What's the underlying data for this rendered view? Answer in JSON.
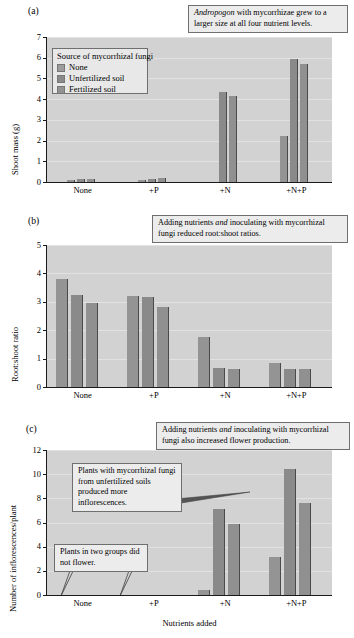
{
  "figure": {
    "xlabel": "Nutrients added",
    "categories": [
      "None",
      "+P",
      "+N",
      "+N+P"
    ],
    "series_names": [
      "None",
      "Unfertilized soil",
      "Fertilized soil"
    ],
    "legend_title": "Source of mycorrhizal fungi",
    "colors": {
      "plot_background": "#d2d2d2",
      "bar_none": "#949494",
      "bar_unfertilized": "#8a8a8a",
      "bar_fertilized": "#909090",
      "callout_background": "#ececec",
      "callout_border": "#6f6f6f",
      "gridline": "#e2e2e2",
      "axis": "#1a1a1a"
    }
  },
  "panels": {
    "a": {
      "label": "(a)",
      "callout": "Andropogon with mycorrhizae grew to a larger size at all four nutrient levels.",
      "callout_italic_word": "Andropogon"
    },
    "b": {
      "label": "(b)",
      "callout": "Adding nutrients and inoculating with mycorrhizal fungi reduced root:shoot ratios.",
      "callout_italic_word": "and"
    },
    "c": {
      "label": "(c)",
      "callout_main": "Adding nutrients and inoculating with mycorrhizal fungi also increased flower production.",
      "callout_main_italic_word": "and",
      "callout_mid": "Plants with mycorrhizal fungi from unfertilized soils produced more inflorescences.",
      "callout_low": "Plants in two groups did not flower."
    }
  },
  "chart_data": [
    {
      "type": "bar",
      "panel": "a",
      "title": "",
      "xlabel": "",
      "ylabel": "Shoot mass (g)",
      "categories": [
        "None",
        "+P",
        "+N",
        "+N+P"
      ],
      "series": [
        {
          "name": "None",
          "values": [
            0.12,
            0.1,
            0.0,
            0.0
          ]
        },
        {
          "name": "Unfertilized soil",
          "values": [
            0.15,
            0.13,
            4.33,
            5.95
          ]
        },
        {
          "name": "Fertilized soil",
          "values": [
            0.15,
            0.2,
            4.15,
            5.7
          ]
        }
      ],
      "special_bars": {
        "note": "+N and +N+P 'None' series bars are absent; +N+P shows a 2.2 bar between groups"
      },
      "extra_bars": [
        {
          "category": "+N+P",
          "series": "None",
          "value": 2.2
        }
      ],
      "ylim": [
        0,
        7
      ],
      "yticks": [
        0,
        1,
        2,
        3,
        4,
        5,
        6,
        7
      ],
      "grid": true,
      "legend_position": "upper-left"
    },
    {
      "type": "bar",
      "panel": "b",
      "title": "",
      "xlabel": "",
      "ylabel": "Root:shoot ratio",
      "categories": [
        "None",
        "+P",
        "+N",
        "+N+P"
      ],
      "series": [
        {
          "name": "None",
          "values": [
            3.82,
            3.22,
            1.77,
            0.85
          ]
        },
        {
          "name": "Unfertilized soil",
          "values": [
            3.23,
            3.18,
            0.67,
            0.63
          ]
        },
        {
          "name": "Fertilized soil",
          "values": [
            2.95,
            2.82,
            0.65,
            0.64
          ]
        }
      ],
      "ylim": [
        0,
        5
      ],
      "yticks": [
        0,
        1,
        2,
        3,
        4,
        5
      ],
      "grid": true,
      "legend_position": "none"
    },
    {
      "type": "bar",
      "panel": "c",
      "title": "",
      "xlabel": "Nutrients added",
      "ylabel": "Number of inflorescences/plant",
      "categories": [
        "None",
        "+P",
        "+N",
        "+N+P"
      ],
      "series": [
        {
          "name": "None",
          "values": [
            0.0,
            0.0,
            0.45,
            3.15
          ]
        },
        {
          "name": "Unfertilized soil",
          "values": [
            0.0,
            0.0,
            7.15,
            10.4
          ]
        },
        {
          "name": "Fertilized soil",
          "values": [
            0.0,
            0.0,
            5.85,
            7.6
          ]
        }
      ],
      "ylim": [
        0,
        12
      ],
      "yticks": [
        0,
        2,
        4,
        6,
        8,
        10,
        12
      ],
      "grid": true,
      "legend_position": "none"
    }
  ]
}
